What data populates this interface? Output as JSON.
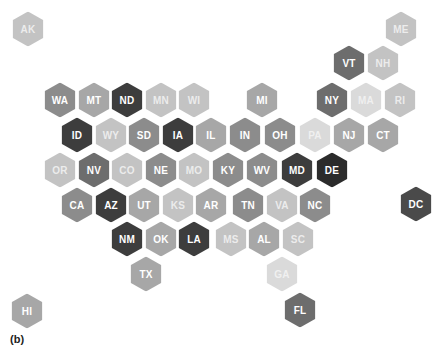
{
  "figure": {
    "panel_label": "(b)"
  },
  "palette": {
    "darkest": "#2b2b2b",
    "very_dark": "#3d3d3d",
    "dark": "#4a4a4a",
    "dark_mid": "#6d6d6d",
    "mid": "#8c8c8c",
    "mid_light": "#a7a7a7",
    "light": "#c3c3c3",
    "lightest": "#dadada"
  },
  "states": [
    {
      "abbr": "AK",
      "x": 28,
      "y": 29,
      "shade": "light"
    },
    {
      "abbr": "ME",
      "x": 401,
      "y": 29,
      "shade": "light"
    },
    {
      "abbr": "VT",
      "x": 349,
      "y": 63,
      "shade": "dark_mid"
    },
    {
      "abbr": "NH",
      "x": 383,
      "y": 63,
      "shade": "light"
    },
    {
      "abbr": "WA",
      "x": 60,
      "y": 100,
      "shade": "mid"
    },
    {
      "abbr": "MT",
      "x": 94,
      "y": 100,
      "shade": "mid_light"
    },
    {
      "abbr": "ND",
      "x": 127,
      "y": 100,
      "shade": "very_dark"
    },
    {
      "abbr": "MN",
      "x": 161,
      "y": 100,
      "shade": "light"
    },
    {
      "abbr": "WI",
      "x": 194,
      "y": 100,
      "shade": "light"
    },
    {
      "abbr": "MI",
      "x": 262,
      "y": 100,
      "shade": "mid_light"
    },
    {
      "abbr": "NY",
      "x": 332,
      "y": 100,
      "shade": "dark_mid"
    },
    {
      "abbr": "MA",
      "x": 366,
      "y": 100,
      "shade": "lightest"
    },
    {
      "abbr": "RI",
      "x": 400,
      "y": 100,
      "shade": "light"
    },
    {
      "abbr": "ID",
      "x": 77,
      "y": 135,
      "shade": "very_dark"
    },
    {
      "abbr": "WY",
      "x": 111,
      "y": 135,
      "shade": "light"
    },
    {
      "abbr": "SD",
      "x": 144,
      "y": 135,
      "shade": "mid"
    },
    {
      "abbr": "IA",
      "x": 178,
      "y": 135,
      "shade": "very_dark"
    },
    {
      "abbr": "IL",
      "x": 211,
      "y": 135,
      "shade": "mid_light"
    },
    {
      "abbr": "IN",
      "x": 245,
      "y": 135,
      "shade": "mid"
    },
    {
      "abbr": "OH",
      "x": 280,
      "y": 135,
      "shade": "mid"
    },
    {
      "abbr": "PA",
      "x": 315,
      "y": 135,
      "shade": "lightest"
    },
    {
      "abbr": "NJ",
      "x": 349,
      "y": 135,
      "shade": "mid_light"
    },
    {
      "abbr": "CT",
      "x": 383,
      "y": 135,
      "shade": "mid_light"
    },
    {
      "abbr": "OR",
      "x": 60,
      "y": 170,
      "shade": "light"
    },
    {
      "abbr": "NV",
      "x": 94,
      "y": 170,
      "shade": "dark_mid"
    },
    {
      "abbr": "CO",
      "x": 127,
      "y": 170,
      "shade": "light"
    },
    {
      "abbr": "NE",
      "x": 161,
      "y": 170,
      "shade": "mid"
    },
    {
      "abbr": "MO",
      "x": 194,
      "y": 170,
      "shade": "light"
    },
    {
      "abbr": "KY",
      "x": 228,
      "y": 170,
      "shade": "mid"
    },
    {
      "abbr": "WV",
      "x": 262,
      "y": 170,
      "shade": "mid"
    },
    {
      "abbr": "MD",
      "x": 297,
      "y": 170,
      "shade": "very_dark"
    },
    {
      "abbr": "DE",
      "x": 332,
      "y": 170,
      "shade": "darkest"
    },
    {
      "abbr": "CA",
      "x": 77,
      "y": 205,
      "shade": "mid"
    },
    {
      "abbr": "AZ",
      "x": 111,
      "y": 205,
      "shade": "very_dark"
    },
    {
      "abbr": "UT",
      "x": 144,
      "y": 205,
      "shade": "mid_light"
    },
    {
      "abbr": "KS",
      "x": 178,
      "y": 205,
      "shade": "light"
    },
    {
      "abbr": "AR",
      "x": 211,
      "y": 205,
      "shade": "mid_light"
    },
    {
      "abbr": "TN",
      "x": 248,
      "y": 205,
      "shade": "mid"
    },
    {
      "abbr": "VA",
      "x": 282,
      "y": 205,
      "shade": "light"
    },
    {
      "abbr": "NC",
      "x": 315,
      "y": 205,
      "shade": "mid"
    },
    {
      "abbr": "DC",
      "x": 416,
      "y": 204,
      "shade": "dark"
    },
    {
      "abbr": "NM",
      "x": 127,
      "y": 239,
      "shade": "very_dark"
    },
    {
      "abbr": "OK",
      "x": 161,
      "y": 239,
      "shade": "mid_light"
    },
    {
      "abbr": "LA",
      "x": 194,
      "y": 239,
      "shade": "very_dark"
    },
    {
      "abbr": "MS",
      "x": 231,
      "y": 239,
      "shade": "light"
    },
    {
      "abbr": "AL",
      "x": 264,
      "y": 239,
      "shade": "mid_light"
    },
    {
      "abbr": "SC",
      "x": 298,
      "y": 239,
      "shade": "light"
    },
    {
      "abbr": "TX",
      "x": 146,
      "y": 274,
      "shade": "mid_light"
    },
    {
      "abbr": "GA",
      "x": 282,
      "y": 274,
      "shade": "lightest"
    },
    {
      "abbr": "HI",
      "x": 27,
      "y": 311,
      "shade": "mid_light"
    },
    {
      "abbr": "FL",
      "x": 300,
      "y": 310,
      "shade": "dark_mid"
    }
  ]
}
